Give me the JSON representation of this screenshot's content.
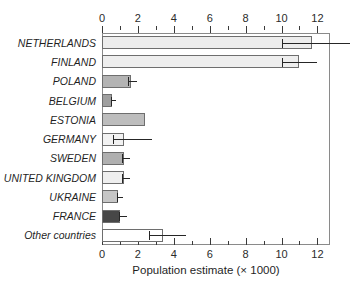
{
  "chart_data": {
    "type": "bar",
    "orientation": "horizontal",
    "title": "",
    "xlabel": "Population estimate (× 1000)",
    "ylabel": "",
    "xlim": [
      0,
      12.7
    ],
    "xticks": [
      0,
      2,
      4,
      6,
      8,
      10,
      12
    ],
    "xtick_labels": [
      "0",
      "2",
      "4",
      "6",
      "8",
      "10",
      "12"
    ],
    "minor_tick_step": 1,
    "grid": false,
    "legend": "none",
    "axis_positions": [
      "top",
      "bottom"
    ],
    "categories": [
      "NETHERLANDS",
      "FINLAND",
      "POLAND",
      "BELGIUM",
      "ESTONIA",
      "GERMANY",
      "SWEDEN",
      "UNITED KINGDOM",
      "UKRAINE",
      "FRANCE",
      "Other countries"
    ],
    "values": [
      11.7,
      11.0,
      1.6,
      0.55,
      2.4,
      1.25,
      1.2,
      1.2,
      0.9,
      1.0,
      3.4
    ],
    "error_low": [
      10.0,
      10.0,
      1.45,
      0.5,
      null,
      0.6,
      1.1,
      1.1,
      0.85,
      0.95,
      2.6
    ],
    "error_high": [
      13.8,
      12.0,
      1.95,
      0.75,
      null,
      2.8,
      1.55,
      1.55,
      1.15,
      1.4,
      4.7
    ],
    "bar_fill_colors": [
      "#ededed",
      "#eeeeee",
      "#b3b3b3",
      "#9f9f9f",
      "#bdbdbd",
      "#f2f2f2",
      "#b0b0b0",
      "#efefef",
      "#c6c6c6",
      "#474747",
      "#ffffff"
    ],
    "bar_edge_color": "#6e6e6e",
    "error_bar_color": "#262626",
    "frame_color": "#8a8a8a",
    "background_color": "#ffffff"
  }
}
